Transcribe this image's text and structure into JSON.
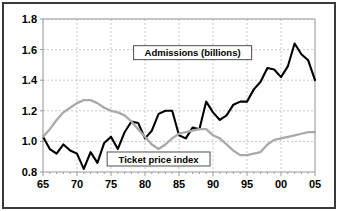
{
  "chart_data": {
    "type": "line",
    "title": "",
    "xlabel": "",
    "ylabel": "",
    "xlim": [
      1965,
      2005
    ],
    "ylim": [
      0.8,
      1.8
    ],
    "xticks": [
      1965,
      1970,
      1975,
      1980,
      1985,
      1990,
      1995,
      2000,
      2005
    ],
    "xtick_labels": [
      "65",
      "70",
      "75",
      "80",
      "85",
      "90",
      "95",
      "00",
      "05"
    ],
    "yticks": [
      0.8,
      1.0,
      1.2,
      1.4,
      1.6,
      1.8
    ],
    "ytick_labels": [
      "0.8",
      "1.0",
      "1.2",
      "1.4",
      "1.6",
      "1.8"
    ],
    "grid": true,
    "legend_position": "inline-annotations",
    "x": [
      1965,
      1966,
      1967,
      1968,
      1969,
      1970,
      1971,
      1972,
      1973,
      1974,
      1975,
      1976,
      1977,
      1978,
      1979,
      1980,
      1981,
      1982,
      1983,
      1984,
      1985,
      1986,
      1987,
      1988,
      1989,
      1990,
      1991,
      1992,
      1993,
      1994,
      1995,
      1996,
      1997,
      1998,
      1999,
      2000,
      2001,
      2002,
      2003,
      2004,
      2005
    ],
    "series": [
      {
        "name": "Admissions (billions)",
        "color": "#000000",
        "values": [
          1.03,
          0.95,
          0.92,
          0.98,
          0.94,
          0.92,
          0.82,
          0.93,
          0.86,
          0.99,
          1.03,
          0.95,
          1.06,
          1.13,
          1.12,
          1.02,
          1.07,
          1.18,
          1.2,
          1.2,
          1.04,
          1.02,
          1.09,
          1.08,
          1.26,
          1.19,
          1.14,
          1.17,
          1.24,
          1.26,
          1.26,
          1.34,
          1.39,
          1.48,
          1.47,
          1.42,
          1.49,
          1.64,
          1.57,
          1.53,
          1.4
        ]
      },
      {
        "name": "Ticket price index",
        "color": "#a9a9a9",
        "values": [
          1.03,
          1.08,
          1.14,
          1.19,
          1.22,
          1.25,
          1.27,
          1.27,
          1.25,
          1.22,
          1.2,
          1.19,
          1.17,
          1.13,
          1.08,
          1.03,
          0.98,
          0.95,
          0.98,
          1.02,
          1.05,
          1.06,
          1.07,
          1.08,
          1.08,
          1.04,
          1.02,
          0.98,
          0.94,
          0.91,
          0.91,
          0.92,
          0.93,
          0.98,
          1.01,
          1.02,
          1.03,
          1.04,
          1.05,
          1.06,
          1.06
        ]
      }
    ],
    "annotations": [
      {
        "label": "Admissions (billions)",
        "x": 1987,
        "y": 1.58
      },
      {
        "label": "Ticket price index",
        "x": 1982,
        "y": 0.885
      }
    ]
  }
}
